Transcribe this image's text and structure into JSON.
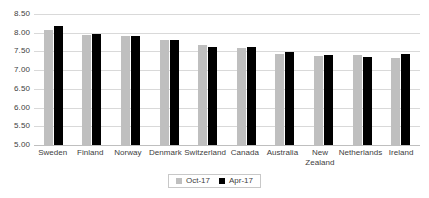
{
  "chart_data": {
    "type": "bar",
    "title": "",
    "xlabel": "",
    "ylabel": "",
    "ylim": [
      5.0,
      8.5
    ],
    "ytick_step": 0.5,
    "grid": true,
    "legend_position": "bottom",
    "categories": [
      "Sweden",
      "Finland",
      "Norway",
      "Denmark",
      "Switzerland",
      "Canada",
      "Australia",
      "New Zealand",
      "Netherlands",
      "Ireland"
    ],
    "ytick_labels": [
      "8.50",
      "8.00",
      "7.50",
      "7.00",
      "6.50",
      "6.00",
      "5.50",
      "5.00"
    ],
    "ytick_values": [
      8.5,
      8.0,
      7.5,
      7.0,
      6.5,
      6.0,
      5.5,
      5.0
    ],
    "series": [
      {
        "name": "Oct-17",
        "color": "#BFBFBF",
        "values": [
          8.08,
          7.94,
          7.9,
          7.81,
          7.66,
          7.6,
          7.43,
          7.39,
          7.4,
          7.33
        ]
      },
      {
        "name": "Apr-17",
        "color": "#000000",
        "values": [
          8.17,
          7.96,
          7.9,
          7.8,
          7.61,
          7.61,
          7.49,
          7.4,
          7.35,
          7.43
        ]
      }
    ]
  },
  "legend": {
    "items": [
      {
        "label": "Oct-17",
        "swatch": "gray-square-icon"
      },
      {
        "label": "Apr-17",
        "swatch": "black-square-icon"
      }
    ]
  }
}
